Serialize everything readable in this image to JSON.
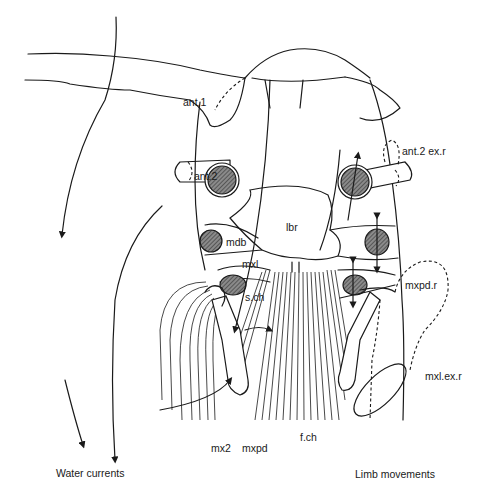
{
  "figure": {
    "type": "anatomical diagram"
  },
  "labels": {
    "ant1": "ant.1",
    "ant2": "ant.2",
    "ant2_exr": "ant.2 ex.r",
    "lbr": "lbr",
    "mdb": "mdb",
    "mxl": "mxl",
    "sch": "s.ch",
    "mxpd_r": "mxpd.r",
    "mxl_ex_r": "mxl.ex.r",
    "mx2": "mx2",
    "mxpd": "mxpd",
    "fch": "f.ch"
  },
  "captions": {
    "left": "Water currents",
    "right": "Limb movements"
  },
  "colors": {
    "ink": "#1a1a1a",
    "background": "#ffffff"
  }
}
